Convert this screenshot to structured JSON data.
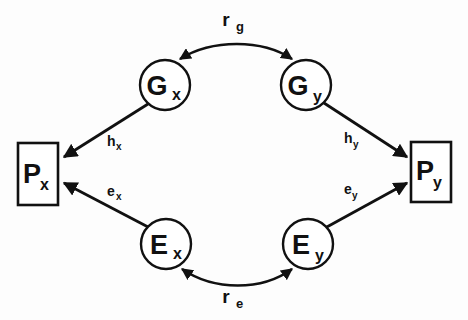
{
  "diagram": {
    "background_color": "#fdfdfd",
    "stroke_color": "#111111",
    "shape_fill": "#ffffff",
    "nodes": [
      {
        "id": "Gx",
        "shape": "circle",
        "main": "G",
        "sub": "x",
        "cx": 165,
        "cy": 85,
        "r": 25
      },
      {
        "id": "Gy",
        "shape": "circle",
        "main": "G",
        "sub": "y",
        "cx": 306,
        "cy": 85,
        "r": 25
      },
      {
        "id": "Ex",
        "shape": "circle",
        "main": "E",
        "sub": "x",
        "cx": 166,
        "cy": 244,
        "r": 25
      },
      {
        "id": "Ey",
        "shape": "circle",
        "main": "E",
        "sub": "y",
        "cx": 308,
        "cy": 244,
        "r": 25
      },
      {
        "id": "Px",
        "shape": "rect",
        "main": "P",
        "sub": "x",
        "x": 18,
        "y": 143,
        "width": 40,
        "height": 62
      },
      {
        "id": "Py",
        "shape": "rect",
        "main": "P",
        "sub": "y",
        "x": 411,
        "y": 142,
        "width": 40,
        "height": 60
      }
    ],
    "paths": [
      {
        "id": "hx",
        "from": "Gx",
        "to": "Px",
        "main": "h",
        "sub": "x",
        "label_x": 113,
        "label_y": 146,
        "arrow": "single"
      },
      {
        "id": "hy",
        "from": "Gy",
        "to": "Py",
        "main": "h",
        "sub": "y",
        "label_x": 348,
        "label_y": 143,
        "arrow": "single"
      },
      {
        "id": "ex",
        "from": "Ex",
        "to": "Px",
        "main": "e",
        "sub": "x",
        "label_x": 113,
        "label_y": 196,
        "arrow": "single"
      },
      {
        "id": "ey",
        "from": "Ey",
        "to": "Py",
        "main": "e",
        "sub": "y",
        "label_x": 348,
        "label_y": 194,
        "arrow": "single"
      }
    ],
    "correlations": [
      {
        "id": "rg",
        "between": "Gx-Gy",
        "main": "r",
        "sub": "g",
        "label_x": 226,
        "label_y": 26,
        "arrow": "double",
        "position": "top"
      },
      {
        "id": "re",
        "between": "Ex-Ey",
        "main": "r",
        "sub": "e",
        "label_x": 226,
        "label_y": 303,
        "arrow": "double",
        "position": "bottom"
      }
    ]
  }
}
